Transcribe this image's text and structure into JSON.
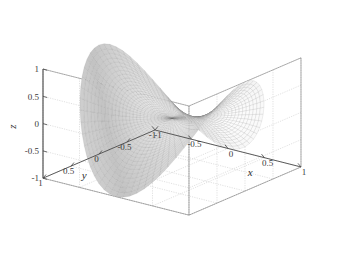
{
  "figure": {
    "kind": "matlab-surface-plot",
    "background_color": "#ffffff",
    "box_line_color": "#4a4a4a",
    "grid_line_color": "#c9c9c9",
    "surface_light_color": "#f2f2f2",
    "surface_dark_color": "#6e6e6e",
    "mesh_line_color": "#8a8a8a"
  },
  "axes": {
    "x": {
      "label": "x",
      "ticks": [
        "-1",
        "-0.5",
        "0",
        "0.5",
        "1"
      ],
      "values": [
        -1,
        -0.5,
        0,
        0.5,
        1
      ],
      "range": [
        -1,
        1
      ]
    },
    "y": {
      "label": "y",
      "ticks": [
        "1",
        "0.5",
        "0",
        "-0.5",
        "-1"
      ],
      "values": [
        1,
        0.5,
        0,
        -0.5,
        -1
      ],
      "range": [
        -1,
        1
      ]
    },
    "z": {
      "label": "z",
      "ticks": [
        "1",
        "0.5",
        "0",
        "-0.5",
        "-1"
      ],
      "values": [
        1,
        0.5,
        0,
        -0.5,
        -1
      ],
      "range": [
        -1,
        1
      ]
    }
  },
  "chart_data": {
    "type": "surface",
    "title": "",
    "xlabel": "x",
    "ylabel": "y",
    "zlabel": "z",
    "xlim": [
      -1,
      1
    ],
    "ylim": [
      -1,
      1
    ],
    "zlim": [
      -1,
      1
    ],
    "xticks": [
      -1,
      -0.5,
      0,
      0.5,
      1
    ],
    "yticks": [
      -1,
      -0.5,
      0,
      0.5,
      1
    ],
    "zticks": [
      -1,
      -0.5,
      0,
      0.5,
      1
    ],
    "xticklabels": [
      "-1",
      "-0.5",
      "0",
      "0.5",
      "1"
    ],
    "yticklabels": [
      "1",
      "0.5",
      "0",
      "-0.5",
      "-1"
    ],
    "zticklabels": [
      "1",
      "0.5",
      "0",
      "-0.5",
      "-1"
    ],
    "grid": true,
    "legend": false,
    "colormap": "gray",
    "shading": "interp-mesh",
    "domain": "unit-disk",
    "surface_equation": "z = r^2 * cos(2*theta)",
    "view": {
      "azimuth": -37.5,
      "elevation": 30
    },
    "radial_divisions": 26,
    "angular_divisions": 72,
    "sample_points": [
      {
        "r": 0.0,
        "theta_deg": 0,
        "z": 0.0
      },
      {
        "r": 1.0,
        "theta_deg": 0,
        "z": 1.0
      },
      {
        "r": 1.0,
        "theta_deg": 45,
        "z": 0.0
      },
      {
        "r": 1.0,
        "theta_deg": 90,
        "z": -1.0
      },
      {
        "r": 1.0,
        "theta_deg": 135,
        "z": 0.0
      },
      {
        "r": 1.0,
        "theta_deg": 180,
        "z": 1.0
      },
      {
        "r": 1.0,
        "theta_deg": 225,
        "z": 0.0
      },
      {
        "r": 1.0,
        "theta_deg": 270,
        "z": -1.0
      },
      {
        "r": 1.0,
        "theta_deg": 315,
        "z": 0.0
      },
      {
        "r": 0.5,
        "theta_deg": 0,
        "z": 0.25
      },
      {
        "r": 0.5,
        "theta_deg": 90,
        "z": -0.25
      }
    ]
  }
}
